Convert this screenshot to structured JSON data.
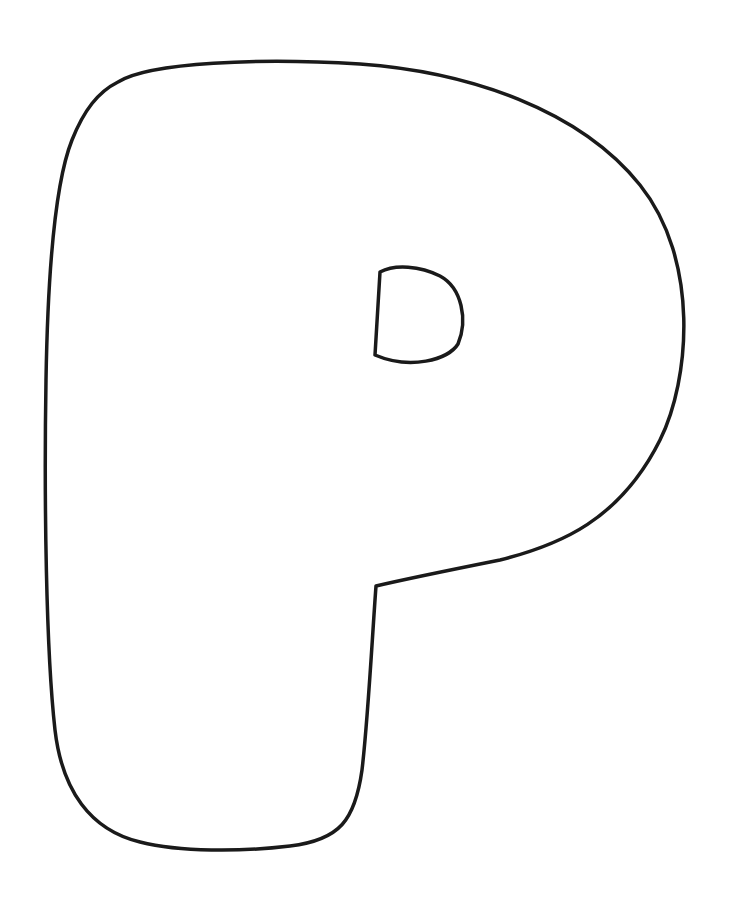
{
  "figure": {
    "letter": "P",
    "stroke_color": "#1a1a1a",
    "fill_color": "#ffffff",
    "background": "#ffffff"
  }
}
